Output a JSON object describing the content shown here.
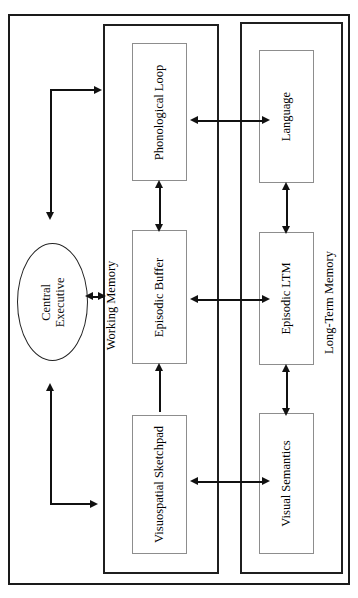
{
  "diagram": {
    "orientation": "rotated-90-ccw",
    "colors": {
      "background": "#ffffff",
      "outer_frame": "#1a1a1a",
      "group_frame": "#1f1f1f",
      "leaf_frame": "#8d8d8d",
      "arrow": "#111111",
      "text": "#111111"
    }
  },
  "nodes": {
    "central_executive": {
      "label": "Central Executive",
      "line1": "Central",
      "line2": "Executive",
      "shape": "ellipse"
    },
    "working_memory": {
      "label": "Working Memory",
      "shape": "group"
    },
    "long_term_memory": {
      "label": "Long-Term Memory",
      "shape": "group"
    },
    "phonological_loop": {
      "label": "Phonological Loop",
      "shape": "box"
    },
    "episodic_buffer": {
      "label": "Episodic Buffer",
      "shape": "box"
    },
    "visuospatial_sketchpad": {
      "label": "Visuospatial Sketchpad",
      "shape": "box"
    },
    "language": {
      "label": "Language",
      "shape": "box"
    },
    "episodic_ltm": {
      "label": "Episodic LTM",
      "shape": "box"
    },
    "visual_semantics": {
      "label": "Visual Semantics",
      "shape": "box"
    }
  },
  "edges": [
    {
      "id": "ce-wm",
      "from": "central_executive",
      "to": "working_memory",
      "type": "bidirectional"
    },
    {
      "id": "ce-pl",
      "from": "central_executive",
      "to": "phonological_loop",
      "type": "directed"
    },
    {
      "id": "vss-ce",
      "from": "visuospatial_sketchpad",
      "to": "central_executive",
      "type": "directed"
    },
    {
      "id": "pl-eb",
      "from": "phonological_loop",
      "to": "episodic_buffer",
      "type": "bidirectional"
    },
    {
      "id": "vss-eb",
      "from": "visuospatial_sketchpad",
      "to": "episodic_buffer",
      "type": "directed"
    },
    {
      "id": "pl-lang",
      "from": "phonological_loop",
      "to": "language",
      "type": "bidirectional"
    },
    {
      "id": "eb-eltm",
      "from": "episodic_buffer",
      "to": "episodic_ltm",
      "type": "bidirectional"
    },
    {
      "id": "vss-vs",
      "from": "visuospatial_sketchpad",
      "to": "visual_semantics",
      "type": "bidirectional"
    },
    {
      "id": "lang-eltm",
      "from": "language",
      "to": "episodic_ltm",
      "type": "bidirectional"
    },
    {
      "id": "eltm-vs",
      "from": "episodic_ltm",
      "to": "visual_semantics",
      "type": "bidirectional"
    }
  ]
}
